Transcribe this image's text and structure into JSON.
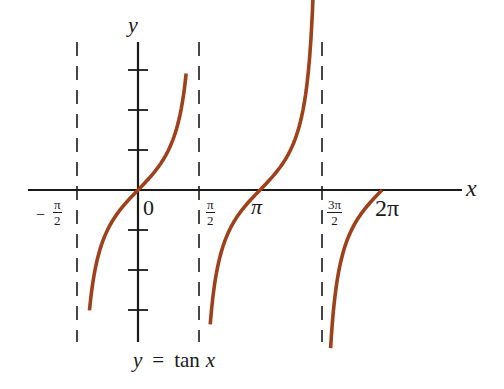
{
  "chart_data": {
    "type": "line",
    "title": "y = tan x",
    "xlabel": "x",
    "ylabel": "y",
    "function": "tan(x)",
    "x_tick_labels": [
      "-π/2",
      "0",
      "π/2",
      "π",
      "3π/2",
      "2π"
    ],
    "x_tick_values": [
      -1.5708,
      0,
      1.5708,
      3.1416,
      4.7124,
      6.2832
    ],
    "y_ticks": [
      -3,
      -2,
      -1,
      1,
      2,
      3
    ],
    "y_tick_labels_shown": false,
    "asymptotes_x": [
      -1.5708,
      1.5708,
      4.7124
    ],
    "asymptote_style": "dashed",
    "xlim": [
      -2.2,
      7.5
    ],
    "ylim": [
      -3.8,
      3.6
    ],
    "grid": false,
    "series": [
      {
        "name": "branch (-π/2, π/2)",
        "x_range": [
          -1.25,
          1.24
        ],
        "y_range": [
          -3.0,
          2.9
        ]
      },
      {
        "name": "branch (π/2, 3π/2)",
        "x_range": [
          1.86,
          4.59
        ],
        "y_range": [
          -3.1,
          2.9
        ]
      },
      {
        "name": "branch (3π/2, 2π)",
        "x_range": [
          4.96,
          6.2832
        ],
        "y_range": [
          -2.9,
          0
        ]
      }
    ],
    "colors": {
      "curve": "#a0401a",
      "axes": "#1a1a1a",
      "asymptote": "#1a1a1a"
    }
  },
  "labels": {
    "x_axis": "x",
    "y_axis": "y",
    "origin": "0",
    "neg_sign": "−",
    "pi": "π",
    "pi_num": "π",
    "three_pi_num": "3π",
    "den": "2",
    "two_pi": "2π",
    "caption": "y = tan x",
    "caption_y": "y",
    "caption_eq": "=",
    "caption_fn": "tan",
    "caption_x": "x"
  }
}
